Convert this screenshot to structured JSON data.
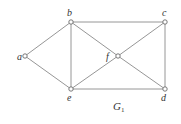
{
  "diagram": {
    "caption": "G",
    "caption_subscript": "1",
    "caption_pos": {
      "x": 113,
      "y": 110
    },
    "colors": {
      "edge": "#8a8a8a",
      "vertex_stroke": "#6a6a6a",
      "vertex_fill": "#ffffff",
      "text": "#333333",
      "background": "#ffffff"
    },
    "vertices": [
      {
        "id": "a",
        "label": "a",
        "x": 25,
        "y": 56,
        "lx": 17,
        "ly": 60
      },
      {
        "id": "b",
        "label": "b",
        "x": 71,
        "y": 22,
        "lx": 67,
        "ly": 16
      },
      {
        "id": "c",
        "label": "c",
        "x": 165,
        "y": 22,
        "lx": 162,
        "ly": 16
      },
      {
        "id": "f",
        "label": "f",
        "x": 118,
        "y": 56,
        "lx": 106,
        "ly": 60
      },
      {
        "id": "e",
        "label": "e",
        "x": 71,
        "y": 89,
        "lx": 67,
        "ly": 101
      },
      {
        "id": "d",
        "label": "d",
        "x": 165,
        "y": 89,
        "lx": 161,
        "ly": 101
      }
    ],
    "edges": [
      [
        "a",
        "b"
      ],
      [
        "a",
        "e"
      ],
      [
        "b",
        "c"
      ],
      [
        "b",
        "e"
      ],
      [
        "b",
        "f"
      ],
      [
        "e",
        "f"
      ],
      [
        "f",
        "c"
      ],
      [
        "f",
        "d"
      ],
      [
        "c",
        "d"
      ],
      [
        "e",
        "d"
      ]
    ]
  }
}
